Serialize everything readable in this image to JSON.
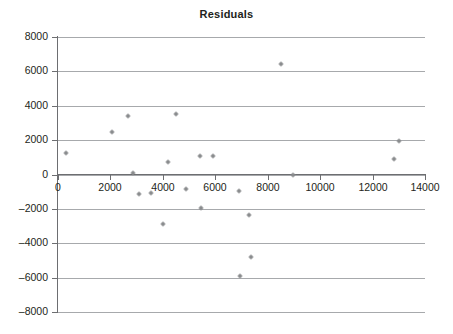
{
  "chart_data": {
    "type": "scatter",
    "title": "Residuals",
    "xlabel": "",
    "ylabel": "",
    "xlim": [
      0,
      14000
    ],
    "ylim": [
      -8000,
      8000
    ],
    "xticks": [
      "0",
      "2000",
      "4000",
      "6000",
      "8000",
      "10000",
      "12000",
      "14000"
    ],
    "xtick_values": [
      0,
      2000,
      4000,
      6000,
      8000,
      10000,
      12000,
      14000
    ],
    "yticks": [
      "8000",
      "6000",
      "4000",
      "2000",
      "0",
      "–2000",
      "–4000",
      "–6000",
      "–8000"
    ],
    "ytick_values": [
      8000,
      6000,
      4000,
      2000,
      0,
      -2000,
      -4000,
      -6000,
      -8000
    ],
    "grid": "horizontal",
    "legend": "none",
    "marker": "cross-dot",
    "marker_color": "#6d6e71",
    "grid_color": "#a7a9ac",
    "axis_color": "#6d6e71",
    "background_color": "#ffffff",
    "points": [
      {
        "x": 300,
        "y": 1250
      },
      {
        "x": 2050,
        "y": 2450
      },
      {
        "x": 2650,
        "y": 3400
      },
      {
        "x": 2850,
        "y": 100
      },
      {
        "x": 3100,
        "y": -1150
      },
      {
        "x": 3550,
        "y": -1050
      },
      {
        "x": 4000,
        "y": -2850
      },
      {
        "x": 4200,
        "y": 750
      },
      {
        "x": 4500,
        "y": 3500
      },
      {
        "x": 4900,
        "y": -850
      },
      {
        "x": 5400,
        "y": 1100
      },
      {
        "x": 5450,
        "y": -1950
      },
      {
        "x": 5900,
        "y": 1100
      },
      {
        "x": 6900,
        "y": -950
      },
      {
        "x": 6950,
        "y": -5900
      },
      {
        "x": 7300,
        "y": -2350
      },
      {
        "x": 7350,
        "y": -4800
      },
      {
        "x": 8500,
        "y": 6450
      },
      {
        "x": 8950,
        "y": 0
      },
      {
        "x": 12800,
        "y": 900
      },
      {
        "x": 13000,
        "y": 1950
      }
    ]
  }
}
